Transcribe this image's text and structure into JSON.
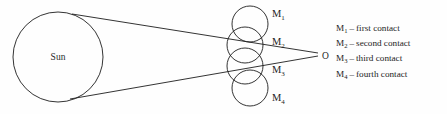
{
  "figure": {
    "background_color": "#fefefe",
    "stroke_color": "#1d1d1d",
    "sun": {
      "label": "Sun",
      "cx": 58,
      "cy": 57,
      "r": 45
    },
    "observer": {
      "label": "O",
      "x": 322,
      "y": 56
    },
    "moons": [
      {
        "label": "M",
        "sub": "1",
        "cx": 250,
        "cy": 24,
        "r": 18,
        "label_x": 272,
        "label_y": 17
      },
      {
        "label": "M",
        "sub": "2",
        "cx": 245,
        "cy": 45,
        "r": 18,
        "label_x": 272,
        "label_y": 45
      },
      {
        "label": "M",
        "sub": "3",
        "cx": 245,
        "cy": 66,
        "r": 18,
        "label_x": 272,
        "label_y": 73
      },
      {
        "label": "M",
        "sub": "4",
        "cx": 250,
        "cy": 88,
        "r": 18,
        "label_x": 272,
        "label_y": 101
      }
    ],
    "tangents": [
      {
        "x1": 72,
        "y1": 14,
        "x2": 318,
        "y2": 53
      },
      {
        "x1": 70,
        "y1": 99,
        "x2": 318,
        "y2": 56
      }
    ]
  },
  "legend": {
    "items": [
      {
        "symbol": "M",
        "sub": "1",
        "dash": "–",
        "text": "first contact"
      },
      {
        "symbol": "M",
        "sub": "2",
        "dash": "–",
        "text": "second contact"
      },
      {
        "symbol": "M",
        "sub": "3",
        "dash": "–",
        "text": "third contact"
      },
      {
        "symbol": "M",
        "sub": "4",
        "dash": "–",
        "text": "fourth contact"
      }
    ]
  }
}
